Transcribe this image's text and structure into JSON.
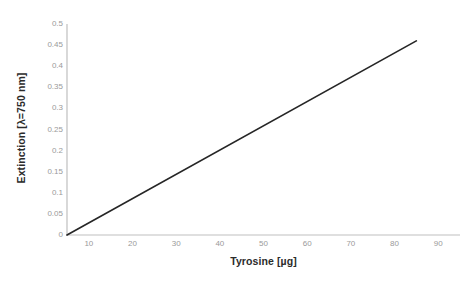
{
  "chart_data": {
    "type": "line",
    "title": "",
    "xlabel": "Tyrosine [µg]",
    "ylabel": "Extinction [λ=750 nm]",
    "xlim": [
      5,
      95
    ],
    "ylim": [
      0,
      0.5
    ],
    "xticks": [
      10,
      20,
      30,
      40,
      50,
      60,
      70,
      80,
      90
    ],
    "xtick_labels": [
      "10",
      "20",
      "30",
      "40",
      "50",
      "60",
      "70",
      "80",
      "90"
    ],
    "yticks": [
      0,
      0.05,
      0.1,
      0.15,
      0.2,
      0.25,
      0.3,
      0.35,
      0.4,
      0.45,
      0.5
    ],
    "ytick_labels": [
      "0",
      "0.05",
      "0.1",
      "0.15",
      "0.2",
      "0.25",
      "0.3",
      "0.35",
      "0.4",
      "0.45",
      "0.5"
    ],
    "grid": false,
    "legend": false,
    "series": [
      {
        "name": "Tyrosine calibration",
        "color": "#262626",
        "x": [
          5,
          85
        ],
        "y": [
          0,
          0.46
        ]
      }
    ],
    "annotations": []
  },
  "style": {
    "background": "#ffffff",
    "axis_color": "#bfbfbf",
    "tick_label_color": "#9a9a9a",
    "axis_title_color": "#2b2b2b",
    "line_color": "#262626"
  }
}
